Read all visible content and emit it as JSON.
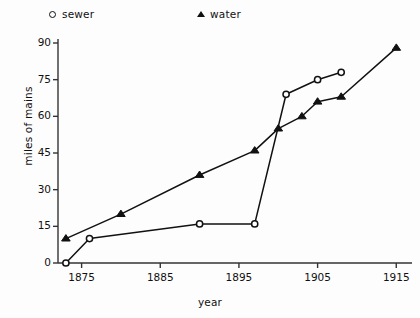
{
  "chart_data": {
    "type": "line",
    "title": "",
    "xlabel": "year",
    "ylabel": "miles of mains",
    "xlim": [
      1872,
      1917
    ],
    "ylim": [
      0,
      95
    ],
    "xticks": [
      1875,
      1885,
      1895,
      1905,
      1915
    ],
    "yticks": [
      0,
      15,
      30,
      45,
      60,
      75,
      90
    ],
    "grid": false,
    "legend_position": "top",
    "series": [
      {
        "name": "sewer",
        "marker": "circle",
        "color": "#111111",
        "points": [
          {
            "x": 1873,
            "y": 0
          },
          {
            "x": 1876,
            "y": 10
          },
          {
            "x": 1890,
            "y": 16
          },
          {
            "x": 1897,
            "y": 16
          },
          {
            "x": 1901,
            "y": 69
          },
          {
            "x": 1905,
            "y": 75
          },
          {
            "x": 1908,
            "y": 78
          }
        ]
      },
      {
        "name": "water",
        "marker": "triangle",
        "color": "#111111",
        "points": [
          {
            "x": 1873,
            "y": 10
          },
          {
            "x": 1880,
            "y": 20
          },
          {
            "x": 1890,
            "y": 36
          },
          {
            "x": 1897,
            "y": 46
          },
          {
            "x": 1900,
            "y": 55
          },
          {
            "x": 1903,
            "y": 60
          },
          {
            "x": 1905,
            "y": 66
          },
          {
            "x": 1908,
            "y": 68
          },
          {
            "x": 1915,
            "y": 88
          }
        ]
      }
    ]
  },
  "legend": {
    "sewer_label": "sewer",
    "water_label": "water"
  },
  "axes": {
    "x_title": "year",
    "y_title": "miles of mains"
  }
}
